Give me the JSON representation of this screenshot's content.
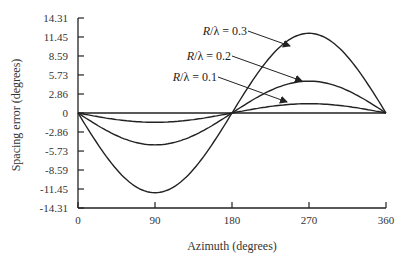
{
  "chart_data": {
    "type": "line",
    "title": "",
    "xlabel": "Azimuth (degrees)",
    "ylabel": "Spacing error (degrees)",
    "xlim": [
      0,
      360
    ],
    "ylim": [
      -14.31,
      14.31
    ],
    "xticks": [
      "0",
      "90",
      "180",
      "270",
      "360"
    ],
    "yticks": [
      "14.31",
      "11.45",
      "8.59",
      "5.73",
      "2.86",
      "0",
      "-2.86",
      "-5.73",
      "-8.59",
      "-11.45",
      "-14.31"
    ],
    "grid": false,
    "legend_position": "inline-annotations",
    "x": [
      0,
      30,
      60,
      90,
      120,
      150,
      180,
      210,
      240,
      270,
      300,
      330,
      360
    ],
    "series": [
      {
        "name": "R/λ = 0.1",
        "label_text": "R/λ = 0.1",
        "values": [
          0,
          -0.7,
          -1.2,
          -1.4,
          -1.2,
          -0.7,
          0,
          0.7,
          1.2,
          1.4,
          1.2,
          0.7,
          0
        ]
      },
      {
        "name": "R/λ = 0.2",
        "label_text": "R/λ = 0.2",
        "values": [
          0,
          -2.4,
          -4.1,
          -4.8,
          -4.1,
          -2.4,
          0,
          2.4,
          4.1,
          4.8,
          4.1,
          2.4,
          0
        ]
      },
      {
        "name": "R/λ = 0.3",
        "label_text": "R/λ = 0.3",
        "values": [
          0,
          -6.0,
          -10.4,
          -12.0,
          -10.4,
          -6.0,
          0,
          6.0,
          10.4,
          12.0,
          10.4,
          6.0,
          0
        ]
      }
    ]
  }
}
